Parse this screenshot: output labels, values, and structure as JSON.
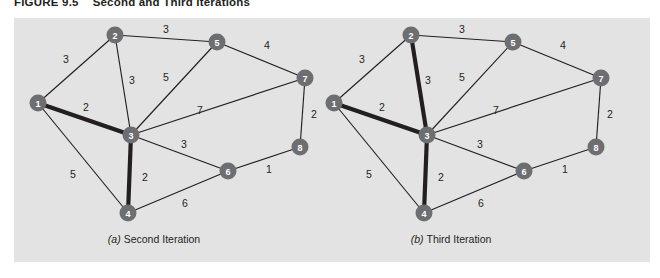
{
  "figure": {
    "label": "FIGURE 9.5",
    "title": "Second and Third Iterations"
  },
  "colors": {
    "panel_background": "#e3e3e3",
    "node_fill": "#6d6e71",
    "node_text": "#ffffff",
    "edge": "#231f20",
    "page_background": "#ffffff"
  },
  "panels": [
    {
      "id": "panel-a",
      "caption_letter": "(a)",
      "caption_text": "Second Iteration",
      "caption_x": 140,
      "caption_y": 225,
      "nodes": [
        {
          "id": "1",
          "label": "1",
          "x": 24,
          "y": 85
        },
        {
          "id": "2",
          "label": "2",
          "x": 101,
          "y": 17
        },
        {
          "id": "3",
          "label": "3",
          "x": 117,
          "y": 117
        },
        {
          "id": "4",
          "label": "4",
          "x": 114,
          "y": 195
        },
        {
          "id": "5",
          "label": "5",
          "x": 203,
          "y": 24
        },
        {
          "id": "6",
          "label": "6",
          "x": 214,
          "y": 153
        },
        {
          "id": "7",
          "label": "7",
          "x": 291,
          "y": 60
        },
        {
          "id": "8",
          "label": "8",
          "x": 286,
          "y": 129
        }
      ],
      "edges": [
        {
          "from": "1",
          "to": "2",
          "weight": "3",
          "bold": false,
          "lx": 52,
          "ly": 42
        },
        {
          "from": "1",
          "to": "3",
          "weight": "2",
          "bold": true,
          "lx": 72,
          "ly": 90
        },
        {
          "from": "1",
          "to": "4",
          "weight": "5",
          "bold": false,
          "lx": 59,
          "ly": 157
        },
        {
          "from": "2",
          "to": "3",
          "weight": "3",
          "bold": false,
          "lx": 118,
          "ly": 63
        },
        {
          "from": "2",
          "to": "5",
          "weight": "3",
          "bold": false,
          "lx": 152,
          "ly": 12
        },
        {
          "from": "3",
          "to": "4",
          "weight": "2",
          "bold": true,
          "lx": 131,
          "ly": 160
        },
        {
          "from": "3",
          "to": "5",
          "weight": "5",
          "bold": false,
          "lx": 152,
          "ly": 60
        },
        {
          "from": "3",
          "to": "6",
          "weight": "3",
          "bold": false,
          "lx": 170,
          "ly": 127
        },
        {
          "from": "3",
          "to": "7",
          "weight": "7",
          "bold": false,
          "lx": 186,
          "ly": 93
        },
        {
          "from": "4",
          "to": "6",
          "weight": "6",
          "bold": false,
          "lx": 171,
          "ly": 186
        },
        {
          "from": "5",
          "to": "7",
          "weight": "4",
          "bold": false,
          "lx": 253,
          "ly": 28
        },
        {
          "from": "6",
          "to": "8",
          "weight": "1",
          "bold": false,
          "lx": 255,
          "ly": 152
        },
        {
          "from": "7",
          "to": "8",
          "weight": "2",
          "bold": false,
          "lx": 300,
          "ly": 97
        }
      ]
    },
    {
      "id": "panel-b",
      "caption_letter": "(b)",
      "caption_text": "Third Iteration",
      "caption_x": 437,
      "caption_y": 225,
      "nodes": [
        {
          "id": "1",
          "label": "1",
          "x": 320,
          "y": 85
        },
        {
          "id": "2",
          "label": "2",
          "x": 397,
          "y": 17
        },
        {
          "id": "3",
          "label": "3",
          "x": 413,
          "y": 117
        },
        {
          "id": "4",
          "label": "4",
          "x": 410,
          "y": 195
        },
        {
          "id": "5",
          "label": "5",
          "x": 499,
          "y": 24
        },
        {
          "id": "6",
          "label": "6",
          "x": 510,
          "y": 153
        },
        {
          "id": "7",
          "label": "7",
          "x": 587,
          "y": 60
        },
        {
          "id": "8",
          "label": "8",
          "x": 582,
          "y": 129
        }
      ],
      "edges": [
        {
          "from": "1",
          "to": "2",
          "weight": "3",
          "bold": false,
          "lx": 348,
          "ly": 42
        },
        {
          "from": "1",
          "to": "3",
          "weight": "2",
          "bold": true,
          "lx": 368,
          "ly": 90
        },
        {
          "from": "1",
          "to": "4",
          "weight": "5",
          "bold": false,
          "lx": 355,
          "ly": 157
        },
        {
          "from": "2",
          "to": "3",
          "weight": "3",
          "bold": true,
          "lx": 414,
          "ly": 63
        },
        {
          "from": "2",
          "to": "5",
          "weight": "3",
          "bold": false,
          "lx": 448,
          "ly": 12
        },
        {
          "from": "3",
          "to": "4",
          "weight": "2",
          "bold": true,
          "lx": 427,
          "ly": 160
        },
        {
          "from": "3",
          "to": "5",
          "weight": "5",
          "bold": false,
          "lx": 448,
          "ly": 60
        },
        {
          "from": "3",
          "to": "6",
          "weight": "3",
          "bold": false,
          "lx": 466,
          "ly": 127
        },
        {
          "from": "3",
          "to": "7",
          "weight": "7",
          "bold": false,
          "lx": 482,
          "ly": 93
        },
        {
          "from": "4",
          "to": "6",
          "weight": "6",
          "bold": false,
          "lx": 467,
          "ly": 186
        },
        {
          "from": "5",
          "to": "7",
          "weight": "4",
          "bold": false,
          "lx": 549,
          "ly": 28
        },
        {
          "from": "6",
          "to": "8",
          "weight": "1",
          "bold": false,
          "lx": 551,
          "ly": 152
        },
        {
          "from": "7",
          "to": "8",
          "weight": "2",
          "bold": false,
          "lx": 596,
          "ly": 97
        }
      ]
    }
  ]
}
